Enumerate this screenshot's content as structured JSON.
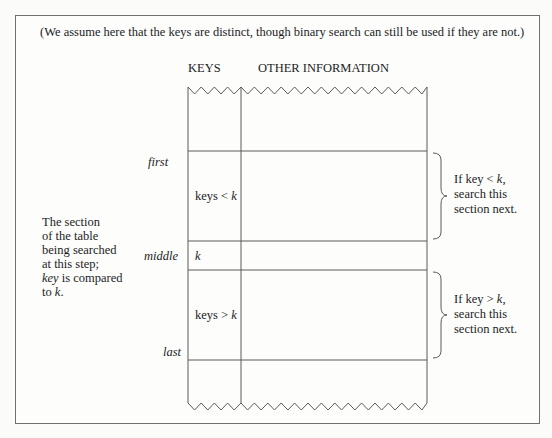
{
  "note": "(We assume here that the keys are distinct, though binary search can still be used if they are not.)",
  "columns": {
    "keys": "KEYS",
    "other": "OTHER INFORMATION"
  },
  "pointers": {
    "first": "first",
    "middle": "middle",
    "last": "last"
  },
  "cells": {
    "lower": {
      "prefix": "keys < ",
      "var": "k"
    },
    "middle": {
      "var": "k"
    },
    "upper": {
      "prefix": "keys > ",
      "var": "k"
    }
  },
  "side_note": {
    "line1": "The section",
    "line2": "of the table",
    "line3": "being searched",
    "line4": "at this step;",
    "line5_var": "key",
    "line5_rest": " is compared",
    "line6_prefix": "to ",
    "line6_var": "k",
    "line6_suffix": "."
  },
  "annotations": {
    "lower": {
      "l1_prefix": "If key < ",
      "l1_var": "k",
      "l1_suffix": ",",
      "l2": "search this",
      "l3": "section next."
    },
    "upper": {
      "l1_prefix": "If key > ",
      "l1_var": "k",
      "l1_suffix": ",",
      "l2": "search this",
      "l3": "section next."
    }
  },
  "colors": {
    "line": "#5a5a5a",
    "text": "#1c1c1c",
    "frame": "#707070"
  }
}
